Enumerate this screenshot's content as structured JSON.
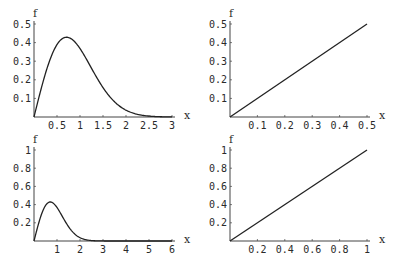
{
  "chart_data": [
    {
      "id": "top-left",
      "type": "line",
      "title": "",
      "xlabel": "x",
      "ylabel": "f",
      "xlim": [
        0,
        3
      ],
      "ylim": [
        0,
        0.5
      ],
      "x_ticks": [
        0.5,
        1,
        1.5,
        2,
        2.5,
        3
      ],
      "x_tick_labels": [
        "0.5",
        "1",
        "1.5",
        "2",
        "2.5",
        "3"
      ],
      "y_ticks": [
        0.1,
        0.2,
        0.3,
        0.4,
        0.5
      ],
      "y_tick_labels": [
        "0.1",
        "0.2",
        "0.3",
        "0.4",
        "0.5"
      ],
      "grid": false,
      "series": [
        {
          "name": "f",
          "formula": "x*exp(-x^2)",
          "x": [
            0,
            0.25,
            0.5,
            0.707,
            1,
            1.25,
            1.5,
            1.75,
            2,
            2.5,
            3
          ],
          "values": [
            0,
            0.235,
            0.389,
            0.429,
            0.368,
            0.262,
            0.158,
            0.082,
            0.037,
            0.005,
            0.0004
          ]
        }
      ],
      "box": {
        "x0": 34,
        "y0": 117,
        "x1": 172,
        "y1": 24
      }
    },
    {
      "id": "top-right",
      "type": "line",
      "title": "",
      "xlabel": "x",
      "ylabel": "f",
      "xlim": [
        0,
        0.5
      ],
      "ylim": [
        0,
        0.5
      ],
      "x_ticks": [
        0.1,
        0.2,
        0.3,
        0.4,
        0.5
      ],
      "x_tick_labels": [
        "0.1",
        "0.2",
        "0.3",
        "0.4",
        "0.5"
      ],
      "y_ticks": [
        0.1,
        0.2,
        0.3,
        0.4,
        0.5
      ],
      "y_tick_labels": [
        "0.1",
        "0.2",
        "0.3",
        "0.4",
        "0.5"
      ],
      "grid": false,
      "series": [
        {
          "name": "f",
          "formula": "x",
          "x": [
            0,
            0.5
          ],
          "values": [
            0,
            0.5
          ]
        }
      ],
      "box": {
        "x0": 230,
        "y0": 117,
        "x1": 367,
        "y1": 24
      }
    },
    {
      "id": "bottom-left",
      "type": "line",
      "title": "",
      "xlabel": "x",
      "ylabel": "f",
      "xlim": [
        0,
        6
      ],
      "ylim": [
        0,
        1
      ],
      "x_ticks": [
        1,
        2,
        3,
        4,
        5,
        6
      ],
      "x_tick_labels": [
        "1",
        "2",
        "3",
        "4",
        "5",
        "6"
      ],
      "y_ticks": [
        0.2,
        0.4,
        0.6,
        0.8,
        1
      ],
      "y_tick_labels": [
        "0.2",
        "0.4",
        "0.6",
        "0.8",
        "1"
      ],
      "grid": false,
      "series": [
        {
          "name": "f",
          "formula": "x*exp(-x^2)",
          "x": [
            0,
            0.5,
            0.707,
            1,
            1.5,
            2,
            2.5,
            3,
            4,
            5,
            6
          ],
          "values": [
            0,
            0.389,
            0.429,
            0.368,
            0.158,
            0.037,
            0.005,
            0.0004,
            0,
            0,
            0
          ]
        }
      ],
      "box": {
        "x0": 34,
        "y0": 241,
        "x1": 172,
        "y1": 150
      }
    },
    {
      "id": "bottom-right",
      "type": "line",
      "title": "",
      "xlabel": "x",
      "ylabel": "f",
      "xlim": [
        0,
        1
      ],
      "ylim": [
        0,
        1
      ],
      "x_ticks": [
        0.2,
        0.4,
        0.6,
        0.8,
        1
      ],
      "x_tick_labels": [
        "0.2",
        "0.4",
        "0.6",
        "0.8",
        "1"
      ],
      "y_ticks": [
        0.2,
        0.4,
        0.6,
        0.8,
        1
      ],
      "y_tick_labels": [
        "0.2",
        "0.4",
        "0.6",
        "0.8",
        "1"
      ],
      "grid": false,
      "series": [
        {
          "name": "f",
          "formula": "x",
          "x": [
            0,
            1
          ],
          "values": [
            0,
            1
          ]
        }
      ],
      "box": {
        "x0": 230,
        "y0": 241,
        "x1": 367,
        "y1": 150
      }
    }
  ],
  "colors": {
    "line": "#222222",
    "axis": "#444444",
    "text": "#2a2a2a",
    "background": "#ffffff"
  }
}
